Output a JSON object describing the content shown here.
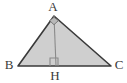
{
  "figure": {
    "kind": "geometry-diagram",
    "background_color": "#ffffff",
    "fill_color": "#cfcfcf",
    "stroke_color": "#3a3a3a",
    "altitude_color": "#8a8a8a",
    "label_color": "#3a3a3a"
  },
  "labels": {
    "apex": "A",
    "left": "B",
    "right": "C",
    "foot": "H"
  },
  "label_positions": {
    "apex": {
      "x": 53,
      "y": 11
    },
    "left": {
      "x": 9,
      "y": 69
    },
    "right": {
      "x": 119,
      "y": 69
    },
    "foot": {
      "x": 55,
      "y": 80
    }
  },
  "points": {
    "A": {
      "x": 54,
      "y": 16
    },
    "B": {
      "x": 18,
      "y": 66
    },
    "C": {
      "x": 111,
      "y": 66
    },
    "H": {
      "x": 56,
      "y": 66
    }
  },
  "triangle_path": "M 54 16 L 18 66 L 111 66 Z",
  "altitude_path": "M 54 16 L 56 66",
  "right_angle_at_H": {
    "path": "M 50 66 L 50 58 L 58 58 L 58 66",
    "size": 8
  },
  "right_angle_at_A": {
    "path": "M 49.6 20.6 L 54 17.3 L 58.4 20.6 L 54 24.7 Z"
  },
  "stroke_widths": {
    "triangle": 1.6,
    "altitude": 1.1,
    "marker": 1.1
  }
}
